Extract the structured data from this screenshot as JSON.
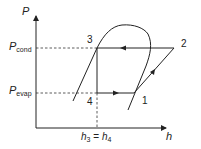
{
  "diagram": {
    "axes": {
      "y_label": "P",
      "x_label": "h"
    },
    "pressure_levels": [
      {
        "symbol": "P",
        "subscript": "cond"
      },
      {
        "symbol": "P",
        "subscript": "evap"
      }
    ],
    "states": [
      {
        "id": "1",
        "label": "1"
      },
      {
        "id": "2",
        "label": "2"
      },
      {
        "id": "3",
        "label": "3"
      },
      {
        "id": "4",
        "label": "4"
      }
    ],
    "x_annotation": {
      "left": {
        "symbol": "h",
        "subscript": "3"
      },
      "equals": "=",
      "right": {
        "symbol": "h",
        "subscript": "4"
      }
    },
    "colors": {
      "line": "#222222",
      "background": "#ffffff"
    }
  }
}
